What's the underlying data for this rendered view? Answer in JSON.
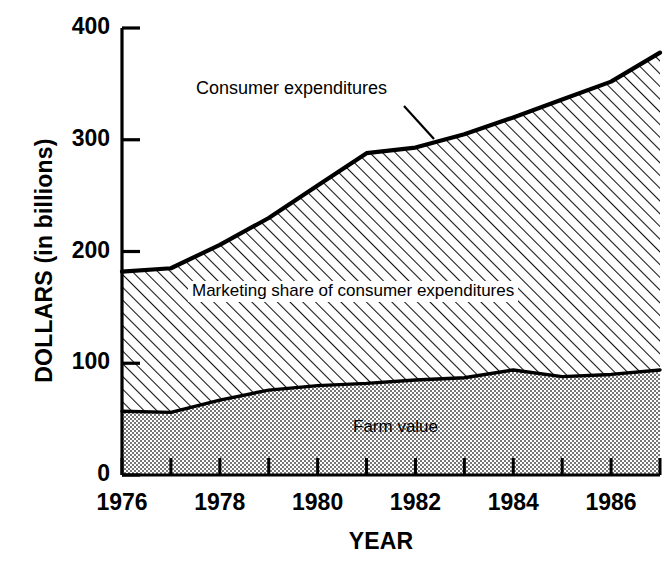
{
  "chart_data": {
    "type": "area",
    "title": "",
    "xlabel": "YEAR",
    "ylabel": "DOLLARS (in billions)",
    "stacked": true,
    "grid": false,
    "legend_position": "inline-annotations",
    "xlim": [
      1976,
      1987
    ],
    "ylim": [
      0,
      400
    ],
    "x": [
      1976,
      1977,
      1978,
      1979,
      1980,
      1981,
      1982,
      1983,
      1984,
      1985,
      1986,
      1987
    ],
    "xticks_major": [
      1976,
      1978,
      1980,
      1982,
      1984,
      1986
    ],
    "xticks_major_labels": [
      "1976",
      "1978",
      "1980",
      "1982",
      "1984",
      "1986"
    ],
    "xticks_minor": [
      1977,
      1979,
      1981,
      1983,
      1985,
      1987
    ],
    "yticks": [
      0,
      100,
      200,
      300,
      400
    ],
    "ytick_labels": [
      "0",
      "100",
      "200",
      "300",
      "400"
    ],
    "series": [
      {
        "name": "Farm value",
        "fill": "stipple",
        "values": [
          57,
          56,
          67,
          76,
          80,
          82,
          85,
          87,
          94,
          88,
          90,
          94
        ]
      },
      {
        "name": "Consumer expenditures",
        "fill": "diagonal-hatch",
        "values": [
          182,
          185,
          206,
          230,
          259,
          288,
          293,
          305,
          320,
          336,
          352,
          378
        ]
      }
    ],
    "annotations": [
      {
        "id": "consumer-expenditures-label",
        "text": "Consumer expenditures",
        "has_leader_line": true
      },
      {
        "id": "marketing-share-label",
        "text": "Marketing share of consumer expenditures",
        "has_leader_line": false
      },
      {
        "id": "farm-value-label",
        "text": "Farm value",
        "has_leader_line": false
      }
    ]
  },
  "colors": {
    "ink": "#000000",
    "background": "#ffffff",
    "hatch": "#1a1a1a",
    "stipple": "#555555"
  }
}
